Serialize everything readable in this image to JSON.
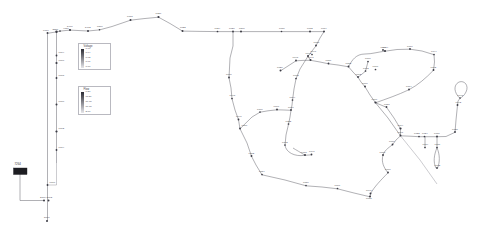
{
  "diagram": {
    "type": "network-graph",
    "background_color": "#ffffff",
    "node_color": "#3b3b44",
    "edge_color": "#8e8e96",
    "label_color": "#4a4a52"
  },
  "source": {
    "label": "7264",
    "symbol": "substation-source"
  },
  "legends": [
    {
      "id": "voltage",
      "title": "Voltage",
      "gradient_from": "#2b2b33",
      "gradient_to": "#e6e6ea",
      "ticks": [
        "1.06",
        "1.04",
        "1.02",
        "1.01",
        "1.00"
      ]
    },
    {
      "id": "flow",
      "title": "Flow",
      "gradient_from": "#2b2b33",
      "gradient_to": "#e6e6ea",
      "ticks": [
        "0.20",
        "11.50",
        "16.90",
        "19.90",
        "2.00"
      ]
    }
  ],
  "nodes": [
    {
      "id": "6716",
      "x": 47.5,
      "y": 33.0,
      "r": 0.95,
      "lx": 43.0,
      "ly": 30.6,
      "anchor": "start"
    },
    {
      "id": "2586",
      "x": 56.5,
      "y": 31.8,
      "r": 1.2,
      "lx": 52.5,
      "ly": 29.6,
      "anchor": "start"
    },
    {
      "id": "4080",
      "x": 60.0,
      "y": 31.0,
      "r": 0.85,
      "lx": 63.0,
      "ly": 28.8,
      "anchor": "start"
    },
    {
      "id": "5400",
      "x": 70.0,
      "y": 30.0,
      "r": 1.1,
      "lx": 67.0,
      "ly": 27.2,
      "anchor": "start"
    },
    {
      "id": "5402",
      "x": 88.0,
      "y": 31.0,
      "r": 1.0,
      "lx": 85.0,
      "ly": 28.2,
      "anchor": "start"
    },
    {
      "id": "6870",
      "x": 99.5,
      "y": 29.8,
      "r": 0.8,
      "lx": 97.0,
      "ly": 26.6,
      "anchor": "start"
    },
    {
      "id": "6718",
      "x": 130.5,
      "y": 20.0,
      "r": 1.0,
      "lx": 127.0,
      "ly": 17.2,
      "anchor": "start"
    },
    {
      "id": "6020",
      "x": 158.5,
      "y": 17.0,
      "r": 1.1,
      "lx": 155.5,
      "ly": 14.2,
      "anchor": "start"
    },
    {
      "id": "6022",
      "x": 182.5,
      "y": 31.0,
      "r": 1.0,
      "lx": 180.0,
      "ly": 28.2,
      "anchor": "start"
    },
    {
      "id": "6024",
      "x": 217.5,
      "y": 31.5,
      "r": 0.85,
      "lx": 214.5,
      "ly": 28.6,
      "anchor": "start"
    },
    {
      "id": "6026",
      "x": 233.0,
      "y": 31.5,
      "r": 0.9,
      "lx": 229.0,
      "ly": 28.6,
      "anchor": "start"
    },
    {
      "id": "6500",
      "x": 241.0,
      "y": 31.5,
      "r": 1.0,
      "lx": 239.0,
      "ly": 28.6,
      "anchor": "start"
    },
    {
      "id": "6030",
      "x": 281.5,
      "y": 31.5,
      "r": 0.8,
      "lx": 279.0,
      "ly": 28.8,
      "anchor": "start"
    },
    {
      "id": "6032",
      "x": 310.0,
      "y": 31.5,
      "r": 0.95,
      "lx": 307.0,
      "ly": 28.8,
      "anchor": "start"
    },
    {
      "id": "6034",
      "x": 324.0,
      "y": 31.5,
      "r": 0.95,
      "lx": 321.0,
      "ly": 28.8,
      "anchor": "start"
    },
    {
      "id": "6038",
      "x": 316.0,
      "y": 45.5,
      "r": 0.9,
      "lx": 313.5,
      "ly": 43.0,
      "anchor": "start"
    },
    {
      "id": "6042",
      "x": 308.0,
      "y": 56.0,
      "r": 1.0,
      "lx": 305.5,
      "ly": 53.6,
      "anchor": "start"
    },
    {
      "id": "6047",
      "x": 312.0,
      "y": 54.5,
      "r": 0.85,
      "lx": 310.5,
      "ly": 52.3,
      "anchor": "start"
    },
    {
      "id": "6041",
      "x": 310.5,
      "y": 60.0,
      "r": 1.0,
      "lx": 308.0,
      "ly": 58.0,
      "anchor": "start"
    },
    {
      "id": "6048",
      "x": 296.0,
      "y": 60.5,
      "r": 0.9,
      "lx": 292.5,
      "ly": 58.2,
      "anchor": "start"
    },
    {
      "id": "6720",
      "x": 280.5,
      "y": 70.5,
      "r": 0.95,
      "lx": 277.0,
      "ly": 68.2,
      "anchor": "start"
    },
    {
      "id": "6680",
      "x": 328.5,
      "y": 63.5,
      "r": 0.9,
      "lx": 325.5,
      "ly": 61.2,
      "anchor": "start"
    },
    {
      "id": "6682",
      "x": 348.5,
      "y": 66.5,
      "r": 0.95,
      "lx": 345.5,
      "ly": 64.2,
      "anchor": "start"
    },
    {
      "id": "6602",
      "x": 358.0,
      "y": 77.0,
      "r": 0.9,
      "lx": 355.5,
      "ly": 74.6,
      "anchor": "start"
    },
    {
      "id": "6600",
      "x": 365.0,
      "y": 86.5,
      "r": 0.95,
      "lx": 362.0,
      "ly": 84.2,
      "anchor": "start"
    },
    {
      "id": "6670",
      "x": 375.5,
      "y": 102.5,
      "r": 1.1,
      "lx": 371.5,
      "ly": 100.2,
      "anchor": "start"
    },
    {
      "id": "6651",
      "x": 386.5,
      "y": 107.0,
      "r": 0.9,
      "lx": 384.0,
      "ly": 104.6,
      "anchor": "start"
    },
    {
      "id": "6714",
      "x": 385.0,
      "y": 51.0,
      "r": 1.1,
      "lx": 382.5,
      "ly": 48.4,
      "anchor": "start"
    },
    {
      "id": "6710",
      "x": 410.0,
      "y": 49.0,
      "r": 0.9,
      "lx": 407.0,
      "ly": 46.6,
      "anchor": "start"
    },
    {
      "id": "6744",
      "x": 434.0,
      "y": 54.5,
      "r": 0.85,
      "lx": 431.0,
      "ly": 52.2,
      "anchor": "start"
    },
    {
      "id": "6772",
      "x": 433.5,
      "y": 70.0,
      "r": 0.95,
      "lx": 430.5,
      "ly": 67.6,
      "anchor": "start"
    },
    {
      "id": "6776",
      "x": 375.5,
      "y": 69.5,
      "r": 0.85,
      "lx": 372.5,
      "ly": 67.2,
      "anchor": "start"
    },
    {
      "id": "6774",
      "x": 409.0,
      "y": 89.5,
      "r": 0.9,
      "lx": 406.0,
      "ly": 87.2,
      "anchor": "start"
    },
    {
      "id": "6748",
      "x": 460.0,
      "y": 98.0,
      "r": 0.8,
      "lx": 457.5,
      "ly": 96.0,
      "anchor": "start"
    },
    {
      "id": "6742",
      "x": 457.5,
      "y": 105.0,
      "r": 0.95,
      "lx": 455.5,
      "ly": 103.2,
      "anchor": "start"
    },
    {
      "id": "6728",
      "x": 455.0,
      "y": 132.0,
      "r": 0.9,
      "lx": 452.0,
      "ly": 129.6,
      "anchor": "start"
    },
    {
      "id": "6674",
      "x": 400.5,
      "y": 128.5,
      "r": 1.1,
      "lx": 397.5,
      "ly": 126.2,
      "anchor": "start"
    },
    {
      "id": "6671",
      "x": 400.5,
      "y": 135.5,
      "r": 0.95,
      "lx": 397.5,
      "ly": 133.4,
      "anchor": "start"
    },
    {
      "id": "6722",
      "x": 419.0,
      "y": 136.5,
      "r": 0.85,
      "lx": 414.0,
      "ly": 134.0,
      "anchor": "start"
    },
    {
      "id": "6724",
      "x": 424.5,
      "y": 136.5,
      "r": 0.85,
      "lx": 422.0,
      "ly": 134.0,
      "anchor": "start"
    },
    {
      "id": "6730",
      "x": 437.0,
      "y": 136.5,
      "r": 0.95,
      "lx": 434.0,
      "ly": 134.0,
      "anchor": "start"
    },
    {
      "id": "6734",
      "x": 425.0,
      "y": 147.5,
      "r": 0.85,
      "lx": 422.5,
      "ly": 145.2,
      "anchor": "start"
    },
    {
      "id": "6736",
      "x": 437.0,
      "y": 147.5,
      "r": 0.85,
      "lx": 434.5,
      "ly": 145.2,
      "anchor": "start"
    },
    {
      "id": "6732",
      "x": 437.0,
      "y": 168.0,
      "r": 0.9,
      "lx": 434.5,
      "ly": 165.8,
      "anchor": "start"
    },
    {
      "id": "6670b",
      "x": 392.5,
      "y": 144.5,
      "r": 0.9,
      "lx": 389.0,
      "ly": 142.2,
      "anchor": "start"
    },
    {
      "id": "6668",
      "x": 383.0,
      "y": 155.0,
      "r": 0.95,
      "lx": 379.5,
      "ly": 152.6,
      "anchor": "start"
    },
    {
      "id": "6666",
      "x": 388.0,
      "y": 172.5,
      "r": 0.9,
      "lx": 385.0,
      "ly": 170.2,
      "anchor": "start"
    },
    {
      "id": "6640",
      "x": 370.5,
      "y": 193.5,
      "r": 0.95,
      "lx": 366.0,
      "ly": 191.2,
      "anchor": "start"
    },
    {
      "id": "6638",
      "x": 370.0,
      "y": 196.5,
      "r": 1.0,
      "lx": 366.0,
      "ly": 198.8,
      "anchor": "start"
    },
    {
      "id": "6666b",
      "x": 337.5,
      "y": 188.5,
      "r": 0.85,
      "lx": 334.5,
      "ly": 186.0,
      "anchor": "start"
    },
    {
      "id": "6650",
      "x": 306.0,
      "y": 185.5,
      "r": 0.85,
      "lx": 303.0,
      "ly": 183.0,
      "anchor": "start"
    },
    {
      "id": "6654",
      "x": 262.0,
      "y": 174.5,
      "r": 0.85,
      "lx": 259.0,
      "ly": 172.0,
      "anchor": "start"
    },
    {
      "id": "6652",
      "x": 251.5,
      "y": 156.0,
      "r": 0.95,
      "lx": 248.5,
      "ly": 153.6,
      "anchor": "start"
    },
    {
      "id": "6650b",
      "x": 240.0,
      "y": 128.5,
      "r": 0.9,
      "lx": 241.5,
      "ly": 126.2,
      "anchor": "start"
    },
    {
      "id": "6646",
      "x": 238.5,
      "y": 119.5,
      "r": 0.9,
      "lx": 236.0,
      "ly": 117.2,
      "anchor": "start"
    },
    {
      "id": "6648",
      "x": 232.0,
      "y": 98.5,
      "r": 0.85,
      "lx": 229.5,
      "ly": 96.2,
      "anchor": "start"
    },
    {
      "id": "6600b",
      "x": 229.0,
      "y": 77.5,
      "r": 0.9,
      "lx": 226.0,
      "ly": 75.2,
      "anchor": "start"
    },
    {
      "id": "6700",
      "x": 260.0,
      "y": 112.0,
      "r": 0.85,
      "lx": 257.0,
      "ly": 109.6,
      "anchor": "start"
    },
    {
      "id": "6696",
      "x": 277.0,
      "y": 109.5,
      "r": 0.95,
      "lx": 273.5,
      "ly": 107.2,
      "anchor": "start"
    },
    {
      "id": "6690",
      "x": 291.0,
      "y": 110.0,
      "r": 0.9,
      "lx": 288.0,
      "ly": 107.6,
      "anchor": "start"
    },
    {
      "id": "6694",
      "x": 292.5,
      "y": 100.0,
      "r": 0.85,
      "lx": 289.5,
      "ly": 97.8,
      "anchor": "start"
    },
    {
      "id": "6692",
      "x": 296.0,
      "y": 78.5,
      "r": 0.85,
      "lx": 293.0,
      "ly": 76.2,
      "anchor": "start"
    },
    {
      "id": "6722b",
      "x": 288.5,
      "y": 124.0,
      "r": 0.85,
      "lx": 285.5,
      "ly": 121.6,
      "anchor": "start"
    },
    {
      "id": "6702",
      "x": 285.0,
      "y": 145.0,
      "r": 0.85,
      "lx": 282.0,
      "ly": 142.6,
      "anchor": "start"
    },
    {
      "id": "6718b",
      "x": 305.0,
      "y": 155.0,
      "r": 1.0,
      "lx": 301.0,
      "ly": 152.6,
      "anchor": "start"
    },
    {
      "id": "6740",
      "x": 311.5,
      "y": 154.5,
      "r": 0.9,
      "lx": 309.0,
      "ly": 152.4,
      "anchor": "start"
    },
    {
      "id": "6604",
      "x": 383.0,
      "y": 50.0,
      "r": 0.9,
      "lx": 380.5,
      "ly": 48.0,
      "anchor": "start"
    },
    {
      "id": "6600c",
      "x": 368.0,
      "y": 61.5,
      "r": 0.85,
      "lx": 365.0,
      "ly": 59.2,
      "anchor": "start"
    },
    {
      "id": "6702b",
      "x": 365.5,
      "y": 71.0,
      "r": 0.85,
      "lx": 363.0,
      "ly": 68.8,
      "anchor": "start"
    },
    {
      "id": "6604b",
      "x": 56.5,
      "y": 55.5,
      "r": 0.9,
      "lx": 58.5,
      "ly": 53.0,
      "anchor": "start"
    },
    {
      "id": "6600d",
      "x": 56.5,
      "y": 63.0,
      "r": 1.1,
      "lx": 58.5,
      "ly": 60.5,
      "anchor": "start"
    },
    {
      "id": "6608",
      "x": 56.5,
      "y": 78.0,
      "r": 0.95,
      "lx": 58.5,
      "ly": 75.6,
      "anchor": "start"
    },
    {
      "id": "6610",
      "x": 56.5,
      "y": 104.5,
      "r": 1.0,
      "lx": 58.5,
      "ly": 102.2,
      "anchor": "start"
    },
    {
      "id": "6612",
      "x": 56.5,
      "y": 131.5,
      "r": 1.1,
      "lx": 58.5,
      "ly": 129.2,
      "anchor": "start"
    },
    {
      "id": "6614",
      "x": 56.5,
      "y": 150.0,
      "r": 0.9,
      "lx": 58.5,
      "ly": 148.0,
      "anchor": "start"
    },
    {
      "id": "6670c",
      "x": 47.5,
      "y": 185.0,
      "r": 0.9,
      "lx": 49.5,
      "ly": 182.5,
      "anchor": "start"
    },
    {
      "id": "2700",
      "x": 44.0,
      "y": 200.5,
      "r": 1.0,
      "lx": 40.0,
      "ly": 197.8,
      "anchor": "start"
    },
    {
      "id": "2702",
      "x": 48.5,
      "y": 200.5,
      "r": 1.0,
      "lx": 46.5,
      "ly": 197.8,
      "anchor": "start"
    },
    {
      "id": "5606",
      "x": 47.0,
      "y": 221.0,
      "r": 1.0,
      "lx": 44.0,
      "ly": 218.4,
      "anchor": "start"
    }
  ],
  "edges_note": "Network edges drawn as connecting lines between nodes"
}
